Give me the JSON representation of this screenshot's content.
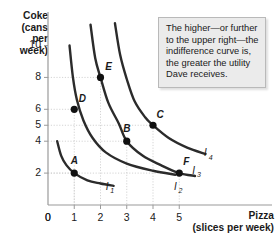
{
  "chart_data": {
    "type": "line",
    "title": "",
    "xlabel": "Pizza",
    "xlabel_sub": "(slices per week)",
    "ylabel": "Coke",
    "ylabel_sub": "(cans per week)",
    "xlim": [
      0,
      6.4
    ],
    "ylim": [
      0,
      11.6
    ],
    "xticks": [
      "0",
      "1",
      "2",
      "3",
      "4",
      "5"
    ],
    "xtick_values": [
      0,
      1,
      2,
      3,
      4,
      5
    ],
    "yticks": [
      "0",
      "2",
      "4",
      "5",
      "6",
      "8",
      "10"
    ],
    "ytick_values": [
      0,
      2,
      4,
      5,
      6,
      8,
      10
    ],
    "grid": "dotted-guides-to-points",
    "legend": "inline-curve-labels",
    "series": [
      {
        "name": "I1",
        "label": "I",
        "label_sub": "1",
        "label_x": 2.25,
        "label_y": 0.95,
        "points": [
          {
            "x": 0.35,
            "y": 4.0
          },
          {
            "x": 0.5,
            "y": 3.1
          },
          {
            "x": 0.7,
            "y": 2.5
          },
          {
            "x": 1.0,
            "y": 2.0
          },
          {
            "x": 1.5,
            "y": 1.55
          },
          {
            "x": 2.0,
            "y": 1.35
          },
          {
            "x": 2.5,
            "y": 1.2
          }
        ]
      },
      {
        "name": "I2",
        "label": "I",
        "label_sub": "2",
        "label_x": 4.85,
        "label_y": 0.95,
        "points": [
          {
            "x": 0.82,
            "y": 10.0
          },
          {
            "x": 0.95,
            "y": 8.0
          },
          {
            "x": 1.1,
            "y": 6.6
          },
          {
            "x": 1.35,
            "y": 5.3
          },
          {
            "x": 1.7,
            "y": 4.2
          },
          {
            "x": 2.2,
            "y": 3.3
          },
          {
            "x": 3.0,
            "y": 2.6
          },
          {
            "x": 4.0,
            "y": 2.15
          },
          {
            "x": 4.85,
            "y": 1.9
          }
        ]
      },
      {
        "name": "I3",
        "label": "I",
        "label_sub": "3",
        "label_x": 5.55,
        "label_y": 1.95,
        "points": [
          {
            "x": 1.62,
            "y": 11.3
          },
          {
            "x": 1.8,
            "y": 9.2
          },
          {
            "x": 2.0,
            "y": 8.0
          },
          {
            "x": 2.3,
            "y": 6.4
          },
          {
            "x": 2.7,
            "y": 5.1
          },
          {
            "x": 3.0,
            "y": 4.0
          },
          {
            "x": 3.6,
            "y": 3.1
          },
          {
            "x": 4.3,
            "y": 2.5
          },
          {
            "x": 5.0,
            "y": 2.0
          },
          {
            "x": 5.6,
            "y": 1.82
          }
        ]
      },
      {
        "name": "I4",
        "label": "I",
        "label_sub": "4",
        "label_x": 6.0,
        "label_y": 3.05,
        "points": [
          {
            "x": 2.55,
            "y": 11.4
          },
          {
            "x": 2.75,
            "y": 9.4
          },
          {
            "x": 3.0,
            "y": 7.9
          },
          {
            "x": 3.3,
            "y": 6.5
          },
          {
            "x": 3.7,
            "y": 5.5
          },
          {
            "x": 4.0,
            "y": 5.0
          },
          {
            "x": 4.6,
            "y": 4.2
          },
          {
            "x": 5.3,
            "y": 3.6
          },
          {
            "x": 6.0,
            "y": 3.2
          }
        ]
      }
    ],
    "annotations": [
      {
        "name": "A",
        "x": 1,
        "y": 2,
        "label_dx": 0,
        "label_dy": -9,
        "guides": [
          "x",
          "y"
        ]
      },
      {
        "name": "B",
        "x": 3,
        "y": 4,
        "label_dx": 0,
        "label_dy": -9,
        "guides": [
          "x",
          "y"
        ]
      },
      {
        "name": "C",
        "x": 4,
        "y": 5,
        "label_dx": 7,
        "label_dy": -7,
        "guides": [
          "x",
          "y"
        ]
      },
      {
        "name": "D",
        "x": 1,
        "y": 6,
        "label_dx": 8,
        "label_dy": -7,
        "guides": [
          "x",
          "y"
        ]
      },
      {
        "name": "E",
        "x": 2,
        "y": 8,
        "label_dx": 8,
        "label_dy": -7,
        "guides": [
          "x",
          "y"
        ]
      },
      {
        "name": "F",
        "x": 5,
        "y": 2,
        "label_dx": 7,
        "label_dy": -8,
        "guides": [
          "x",
          "y"
        ]
      }
    ]
  },
  "callout": {
    "text": "The higher—or further to the upper right—the indifference curve is, the greater the utility Dave receives."
  },
  "colors": {
    "curve": "#2b2b2b",
    "point": "#111111",
    "axis": "#9a9a9a",
    "grid": "#c9c9c9",
    "callout_bg": "#ebebeb",
    "callout_border": "#b9b9b9",
    "text": "#1a1a1a"
  }
}
